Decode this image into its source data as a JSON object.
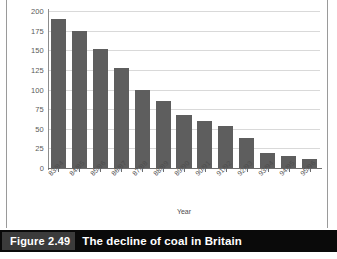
{
  "figure": {
    "caption_number": "Figure 2.49",
    "caption_title": "The decline of coal in Britain"
  },
  "colors": {
    "bar_fill": "#5e5e5e",
    "gridline": "#d9d9d9",
    "axis_line": "#6d6d6d",
    "caption_bar_bg": "#0a0a0a",
    "caption_number_bg": "#3b3b3b",
    "caption_text": "#ffffff",
    "tick_text": "#4d4d4d",
    "plot_bg": "#ffffff"
  },
  "chart_data": {
    "type": "bar",
    "title": "The decline of coal in Britain",
    "xlabel": "Year",
    "ylabel": "",
    "categories": [
      "83/84",
      "84/85",
      "85/86",
      "86/87",
      "87/88",
      "88/89",
      "89/90",
      "90/91",
      "91/92",
      "92/93",
      "93/94",
      "94/95",
      "95/96"
    ],
    "values": [
      190,
      175,
      151,
      127,
      100,
      86,
      68,
      60,
      53,
      38,
      19,
      15,
      12
    ],
    "ylim": [
      0,
      200
    ],
    "yticks": [
      0,
      25,
      50,
      75,
      100,
      125,
      150,
      175,
      200
    ],
    "ytick_labels": [
      "0",
      "25",
      "50",
      "75",
      "100",
      "125",
      "150",
      "175",
      "200"
    ],
    "grid": true,
    "legend": false,
    "legend_position": "none",
    "series": [
      {
        "name": "Coal output",
        "values": [
          190,
          175,
          151,
          127,
          100,
          86,
          68,
          60,
          53,
          38,
          19,
          15,
          12
        ]
      }
    ]
  }
}
